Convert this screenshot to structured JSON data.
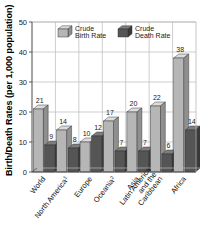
{
  "chart_data": {
    "type": "bar",
    "title": "",
    "xlabel": "",
    "ylabel": "Birth/Death Rates (per 1,000 population)",
    "ylim": [
      0,
      50
    ],
    "yticks": [
      0,
      10,
      20,
      30,
      40,
      50
    ],
    "grid": true,
    "legend_position": "top-inside",
    "categories": [
      "World",
      "North America",
      "Europe",
      "Oceania",
      "Asia",
      "Latin America and the Caribbean",
      "Africa"
    ],
    "category_footnotes": [
      "",
      "1",
      "",
      "2",
      "",
      "",
      ""
    ],
    "category_lines": [
      [
        "World"
      ],
      [
        "North America"
      ],
      [
        "Europe"
      ],
      [
        "Oceania"
      ],
      [
        "Asia"
      ],
      [
        "Latin America",
        "and the",
        "Caribbean"
      ],
      [
        "Africa"
      ]
    ],
    "series": [
      {
        "name": "Crude Birth Rate",
        "color": "#b6b6b6",
        "values": [
          21,
          14,
          10,
          17,
          20,
          22,
          38
        ]
      },
      {
        "name": "Crude Death Rate",
        "color": "#555555",
        "values": [
          9,
          8,
          12,
          7,
          7,
          6,
          14
        ]
      }
    ]
  },
  "legend": {
    "items": [
      {
        "label_line1": "Crude",
        "label_line2": "Birth Rate",
        "swatch": "light-cube-icon"
      },
      {
        "label_line1": "Crude",
        "label_line2": "Death Rate",
        "swatch": "dark-cube-icon"
      }
    ]
  },
  "axis": {
    "y_title": "Birth/Death Rates (per 1,000 population)",
    "y_tick_labels": [
      "0",
      "10",
      "20",
      "30",
      "40",
      "50"
    ]
  },
  "value_labels": {
    "birth": [
      "21",
      "14",
      "10",
      "17",
      "20",
      "22",
      "38"
    ],
    "death": [
      "9",
      "8",
      "12",
      "7",
      "7",
      "6",
      "14"
    ]
  },
  "colors": {
    "birth_front": "#b6b6b6",
    "birth_top": "#dcdcdc",
    "birth_side": "#8f8f8f",
    "death_front": "#555555",
    "death_top": "#7d7d7d",
    "death_side": "#3a3a3a",
    "grid": "#b9b9b9",
    "axis": "#4a4a4a",
    "background": "#ffffff"
  }
}
